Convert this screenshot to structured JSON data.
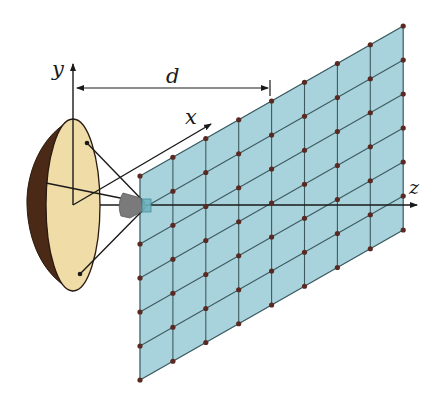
{
  "diagram": {
    "labels": {
      "y_axis": "y",
      "x_axis": "x",
      "z_axis": "z",
      "distance": "d"
    },
    "colors": {
      "background": "#ffffff",
      "dish_face": "#efdca6",
      "dish_rim": "#4a2a16",
      "dish_outline": "#2a1a10",
      "feed_horn": "#7a7a7a",
      "feed_cube": "#6fb3bf",
      "grid_plane": "#a9d3dc",
      "grid_lines": "#3d5a60",
      "grid_points": "#5a2a22",
      "axis_lines": "#1a1a1a"
    },
    "grid": {
      "columns": 9,
      "rows": 7,
      "origin_bottom_left": [
        140,
        380
      ],
      "column_step": [
        32.9,
        -18.75
      ],
      "row_step": [
        0,
        -34
      ]
    },
    "geometry": {
      "origin": [
        73,
        205
      ],
      "dish_center": [
        73,
        205
      ],
      "dish_rx": 27,
      "dish_ry": 86,
      "focal_point": [
        146,
        205
      ]
    }
  }
}
